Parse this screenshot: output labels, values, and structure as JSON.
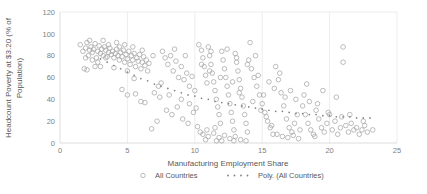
{
  "chart_data": {
    "type": "scatter",
    "title": "",
    "xlabel": "Manufacturing Employment Share",
    "ylabel": "Headcount Poverty at $3.20 (% of Population)",
    "xlim": [
      0,
      25
    ],
    "ylim": [
      0,
      120
    ],
    "xticks": [
      0,
      5,
      10,
      15,
      20,
      25
    ],
    "yticks": [
      0,
      20,
      40,
      60,
      80,
      100,
      120
    ],
    "grid": "vertical",
    "legend_position": "bottom",
    "series": [
      {
        "name": "All Countries",
        "type": "scatter",
        "marker": "open-circle",
        "color": "#a6a6a6",
        "points": [
          [
            1.5,
            90
          ],
          [
            1.7,
            84
          ],
          [
            1.9,
            87
          ],
          [
            2.0,
            92
          ],
          [
            2.1,
            80
          ],
          [
            2.2,
            85
          ],
          [
            2.3,
            88
          ],
          [
            2.4,
            83
          ],
          [
            2.5,
            86
          ],
          [
            2.6,
            91
          ],
          [
            2.7,
            78
          ],
          [
            2.8,
            84
          ],
          [
            2.9,
            89
          ],
          [
            3.0,
            82
          ],
          [
            3.1,
            86
          ],
          [
            3.2,
            80
          ],
          [
            3.3,
            88
          ],
          [
            3.4,
            85
          ],
          [
            3.5,
            79
          ],
          [
            3.6,
            83
          ],
          [
            3.7,
            87
          ],
          [
            3.8,
            81
          ],
          [
            3.9,
            84
          ],
          [
            4.0,
            78
          ],
          [
            4.1,
            82
          ],
          [
            4.2,
            86
          ],
          [
            4.3,
            80
          ],
          [
            4.4,
            76
          ],
          [
            4.5,
            83
          ],
          [
            4.6,
            79
          ],
          [
            4.7,
            85
          ],
          [
            4.8,
            74
          ],
          [
            4.9,
            81
          ],
          [
            5.0,
            77
          ],
          [
            5.1,
            84
          ],
          [
            5.2,
            72
          ],
          [
            5.3,
            80
          ],
          [
            5.4,
            76
          ],
          [
            5.5,
            82
          ],
          [
            5.6,
            70
          ],
          [
            5.7,
            78
          ],
          [
            5.8,
            75
          ],
          [
            5.9,
            81
          ],
          [
            6.0,
            68
          ],
          [
            6.1,
            74
          ],
          [
            6.2,
            79
          ],
          [
            6.3,
            71
          ],
          [
            6.4,
            76
          ],
          [
            6.5,
            66
          ],
          [
            6.6,
            73
          ],
          [
            1.8,
            68
          ],
          [
            2.2,
            94
          ],
          [
            3.2,
            94
          ],
          [
            3.6,
            90
          ],
          [
            4.4,
            88
          ],
          [
            2.0,
            67
          ],
          [
            3.0,
            70
          ],
          [
            4.0,
            69
          ],
          [
            5.0,
            66
          ],
          [
            5.5,
            59
          ],
          [
            4.6,
            49
          ],
          [
            5.0,
            44
          ],
          [
            5.6,
            45
          ],
          [
            6.0,
            38
          ],
          [
            6.3,
            37
          ],
          [
            6.8,
            13
          ],
          [
            7.2,
            20
          ],
          [
            7.5,
            55
          ],
          [
            7.8,
            78
          ],
          [
            8.0,
            72
          ],
          [
            8.2,
            80
          ],
          [
            8.4,
            66
          ],
          [
            8.6,
            75
          ],
          [
            8.8,
            60
          ],
          [
            9.0,
            70
          ],
          [
            9.2,
            58
          ],
          [
            9.4,
            64
          ],
          [
            9.6,
            52
          ],
          [
            9.8,
            61
          ],
          [
            10.0,
            48
          ],
          [
            7.0,
            46
          ],
          [
            7.4,
            42
          ],
          [
            7.9,
            30
          ],
          [
            8.3,
            26
          ],
          [
            8.7,
            33
          ],
          [
            9.1,
            22
          ],
          [
            9.5,
            18
          ],
          [
            9.9,
            28
          ],
          [
            10.2,
            15
          ],
          [
            10.4,
            10
          ],
          [
            10.5,
            85
          ],
          [
            10.6,
            78
          ],
          [
            10.7,
            70
          ],
          [
            10.8,
            62
          ],
          [
            10.9,
            55
          ],
          [
            11.0,
            88
          ],
          [
            11.1,
            80
          ],
          [
            11.2,
            72
          ],
          [
            11.3,
            64
          ],
          [
            11.4,
            56
          ],
          [
            11.5,
            48
          ],
          [
            11.6,
            40
          ],
          [
            11.7,
            33
          ],
          [
            11.8,
            26
          ],
          [
            11.9,
            18
          ],
          [
            12.0,
            84
          ],
          [
            12.1,
            76
          ],
          [
            12.2,
            68
          ],
          [
            12.3,
            60
          ],
          [
            12.4,
            52
          ],
          [
            12.5,
            44
          ],
          [
            12.6,
            36
          ],
          [
            12.7,
            28
          ],
          [
            12.8,
            20
          ],
          [
            12.9,
            12
          ],
          [
            13.0,
            82
          ],
          [
            13.1,
            74
          ],
          [
            13.2,
            66
          ],
          [
            13.3,
            58
          ],
          [
            13.4,
            50
          ],
          [
            13.5,
            42
          ],
          [
            13.6,
            34
          ],
          [
            13.7,
            26
          ],
          [
            13.8,
            18
          ],
          [
            13.9,
            10
          ],
          [
            10.6,
            8
          ],
          [
            11.0,
            6
          ],
          [
            11.4,
            9
          ],
          [
            11.8,
            5
          ],
          [
            12.2,
            7
          ],
          [
            12.6,
            4
          ],
          [
            13.0,
            6
          ],
          [
            13.4,
            3
          ],
          [
            10.9,
            12
          ],
          [
            11.5,
            14
          ],
          [
            14.0,
            76
          ],
          [
            14.2,
            68
          ],
          [
            14.4,
            60
          ],
          [
            14.6,
            52
          ],
          [
            14.8,
            44
          ],
          [
            15.0,
            36
          ],
          [
            15.2,
            28
          ],
          [
            15.4,
            20
          ],
          [
            15.6,
            14
          ],
          [
            15.8,
            8
          ],
          [
            14.1,
            92
          ],
          [
            14.5,
            80
          ],
          [
            14.9,
            30
          ],
          [
            15.3,
            24
          ],
          [
            15.7,
            16
          ],
          [
            16.0,
            70
          ],
          [
            16.2,
            58
          ],
          [
            16.4,
            46
          ],
          [
            16.6,
            34
          ],
          [
            16.8,
            22
          ],
          [
            17.0,
            14
          ],
          [
            17.2,
            10
          ],
          [
            17.4,
            18
          ],
          [
            17.6,
            26
          ],
          [
            17.8,
            12
          ],
          [
            16.1,
            8
          ],
          [
            16.5,
            6
          ],
          [
            16.9,
            5
          ],
          [
            17.3,
            7
          ],
          [
            17.7,
            4
          ],
          [
            18.0,
            34
          ],
          [
            18.2,
            26
          ],
          [
            18.4,
            18
          ],
          [
            18.6,
            12
          ],
          [
            18.8,
            8
          ],
          [
            18.1,
            44
          ],
          [
            18.5,
            38
          ],
          [
            18.9,
            6
          ],
          [
            19.0,
            30
          ],
          [
            19.2,
            22
          ],
          [
            19.4,
            14
          ],
          [
            19.6,
            10
          ],
          [
            19.8,
            18
          ],
          [
            20.0,
            26
          ],
          [
            20.2,
            12
          ],
          [
            20.4,
            20
          ],
          [
            20.6,
            8
          ],
          [
            20.8,
            14
          ],
          [
            21.0,
            88
          ],
          [
            21.0,
            74
          ],
          [
            21.2,
            16
          ],
          [
            21.4,
            10
          ],
          [
            21.6,
            18
          ],
          [
            21.8,
            12
          ],
          [
            22.0,
            14
          ],
          [
            22.2,
            8
          ],
          [
            22.4,
            12
          ],
          [
            22.6,
            16
          ],
          [
            22.8,
            10
          ],
          [
            23.2,
            12
          ],
          [
            20.5,
            42
          ],
          [
            19.5,
            48
          ],
          [
            18.3,
            54
          ],
          [
            17.5,
            40
          ],
          [
            16.3,
            64
          ],
          [
            15.5,
            56
          ],
          [
            14.7,
            62
          ],
          [
            13.9,
            72
          ],
          [
            13.1,
            78
          ],
          [
            12.4,
            86
          ],
          [
            11.2,
            84
          ],
          [
            10.3,
            90
          ],
          [
            9.3,
            80
          ],
          [
            8.5,
            86
          ],
          [
            7.6,
            84
          ],
          [
            6.9,
            80
          ],
          [
            6.1,
            85
          ],
          [
            5.4,
            88
          ],
          [
            4.8,
            90
          ],
          [
            4.2,
            92
          ],
          [
            3.4,
            78
          ],
          [
            2.8,
            74
          ],
          [
            2.4,
            76
          ],
          [
            1.9,
            78
          ],
          [
            2.6,
            70
          ],
          [
            12.0,
            2
          ],
          [
            12.9,
            2
          ],
          [
            13.8,
            2
          ],
          [
            11.6,
            2
          ],
          [
            10.8,
            3
          ],
          [
            9.0,
            40
          ],
          [
            9.6,
            36
          ],
          [
            10.1,
            32
          ],
          [
            8.1,
            44
          ],
          [
            7.3,
            52
          ],
          [
            14.3,
            38
          ],
          [
            15.1,
            44
          ],
          [
            15.9,
            50
          ],
          [
            16.7,
            42
          ],
          [
            17.1,
            48
          ],
          [
            19.1,
            36
          ],
          [
            19.9,
            28
          ],
          [
            20.9,
            24
          ],
          [
            21.5,
            26
          ],
          [
            22.5,
            20
          ],
          [
            12.8,
            56
          ],
          [
            13.3,
            46
          ],
          [
            11.9,
            60
          ],
          [
            11.1,
            66
          ],
          [
            10.5,
            72
          ]
        ]
      },
      {
        "name": "Poly. (All Countries)",
        "type": "line",
        "style": "dotted",
        "color": "#808080",
        "points": [
          [
            3.0,
            77
          ],
          [
            3.5,
            74
          ],
          [
            4.0,
            71
          ],
          [
            4.5,
            68
          ],
          [
            5.0,
            65
          ],
          [
            5.5,
            62
          ],
          [
            6.0,
            59
          ],
          [
            6.5,
            57
          ],
          [
            7.0,
            54
          ],
          [
            7.5,
            52
          ],
          [
            8.0,
            50
          ],
          [
            8.5,
            48
          ],
          [
            9.0,
            46
          ],
          [
            9.5,
            44
          ],
          [
            10.0,
            43
          ],
          [
            10.5,
            41
          ],
          [
            11.0,
            40
          ],
          [
            11.5,
            38
          ],
          [
            12.0,
            37
          ],
          [
            12.5,
            36
          ],
          [
            13.0,
            35
          ],
          [
            13.5,
            34
          ],
          [
            14.0,
            33
          ],
          [
            14.5,
            32
          ],
          [
            15.0,
            31
          ],
          [
            15.5,
            30
          ],
          [
            16.0,
            29
          ],
          [
            16.5,
            29
          ],
          [
            17.0,
            28
          ],
          [
            17.5,
            27
          ],
          [
            18.0,
            27
          ],
          [
            18.5,
            26
          ],
          [
            19.0,
            26
          ],
          [
            19.5,
            25
          ],
          [
            20.0,
            25
          ],
          [
            20.5,
            24
          ],
          [
            21.0,
            24
          ],
          [
            21.5,
            24
          ],
          [
            22.0,
            23
          ],
          [
            22.5,
            23
          ],
          [
            23.0,
            23
          ]
        ]
      }
    ]
  },
  "legend": {
    "items": [
      {
        "label": "All Countries",
        "marker": "open-circle"
      },
      {
        "label": "Poly. (All Countries)",
        "marker": "dotted-line"
      }
    ]
  },
  "colors": {
    "marker_stroke": "#a6a6a6",
    "trend": "#808080",
    "grid": "#e8e8e8",
    "axis": "#d9d9d9",
    "tick_text": "#808080",
    "title_text": "#595959"
  }
}
